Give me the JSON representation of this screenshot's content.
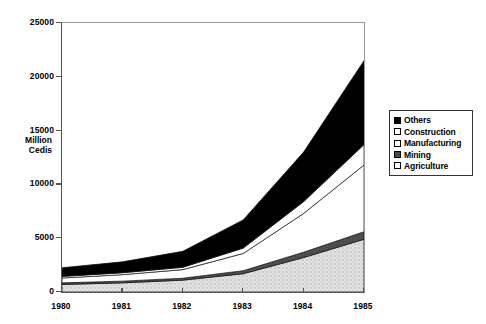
{
  "chart_data": {
    "type": "area",
    "title": "",
    "subtitle": "",
    "xlabel": "",
    "ylabel": "Million Cedis",
    "ylabel_lines": [
      "Million",
      "Cedis"
    ],
    "stacked": true,
    "x": [
      1980,
      1981,
      1982,
      1983,
      1984,
      1985
    ],
    "categories": [
      "1980",
      "1981",
      "1982",
      "1983",
      "1984",
      "1985"
    ],
    "xlim": [
      1980,
      1985
    ],
    "ylim": [
      0,
      25000
    ],
    "yticks": [
      0,
      5000,
      10000,
      15000,
      20000,
      25000
    ],
    "ytick_labels": [
      "0",
      "5000",
      "10000",
      "15000",
      "20000",
      "25000"
    ],
    "xticks": [
      1980,
      1981,
      1982,
      1983,
      1984,
      1985
    ],
    "xtick_labels": [
      "1980",
      "1981",
      "1982",
      "1983",
      "1984",
      "1985"
    ],
    "grid": false,
    "legend_position": "right",
    "stack_order_bottom_to_top": [
      "Agriculture",
      "Mining",
      "Manufacturing",
      "Construction",
      "Others"
    ],
    "series": [
      {
        "name": "Agriculture",
        "fill": "#d9d9d9",
        "values": [
          700,
          850,
          1100,
          1700,
          3200,
          4900
        ]
      },
      {
        "name": "Mining",
        "fill": "#4a4a4a",
        "values": [
          150,
          160,
          180,
          280,
          500,
          700
        ]
      },
      {
        "name": "Manufacturing",
        "fill": "#ffffff",
        "values": [
          450,
          600,
          800,
          1600,
          3600,
          6200
        ]
      },
      {
        "name": "Construction",
        "fill": "#ffffff",
        "values": [
          150,
          180,
          220,
          500,
          1100,
          1900
        ]
      },
      {
        "name": "Others",
        "fill": "#000000",
        "values": [
          800,
          1010,
          1480,
          2620,
          4600,
          7800
        ]
      }
    ],
    "cumulative_tops": {
      "Agriculture": [
        700,
        850,
        1100,
        1700,
        3200,
        4900
      ],
      "Mining": [
        850,
        1010,
        1280,
        1980,
        3700,
        5600
      ],
      "Manufacturing": [
        1300,
        1610,
        2080,
        3580,
        7300,
        11800
      ],
      "Construction": [
        1450,
        1790,
        2300,
        4080,
        8400,
        13700
      ],
      "Others": [
        2250,
        2800,
        3780,
        6700,
        13000,
        21500
      ]
    },
    "totals": [
      2250,
      2800,
      3780,
      6700,
      13000,
      21500
    ]
  },
  "legend": {
    "items": [
      {
        "label": "Others",
        "swatch": "solid-black"
      },
      {
        "label": "Construction",
        "swatch": "white"
      },
      {
        "label": "Manufacturing",
        "swatch": "white"
      },
      {
        "label": "Mining",
        "swatch": "dark-gray"
      },
      {
        "label": "Agriculture",
        "swatch": "white"
      }
    ]
  },
  "colors": {
    "others": "#000000",
    "construction": "#ffffff",
    "manufacturing": "#ffffff",
    "mining": "#4a4a4a",
    "agriculture": "#d9d9d9",
    "axis": "#555555"
  }
}
